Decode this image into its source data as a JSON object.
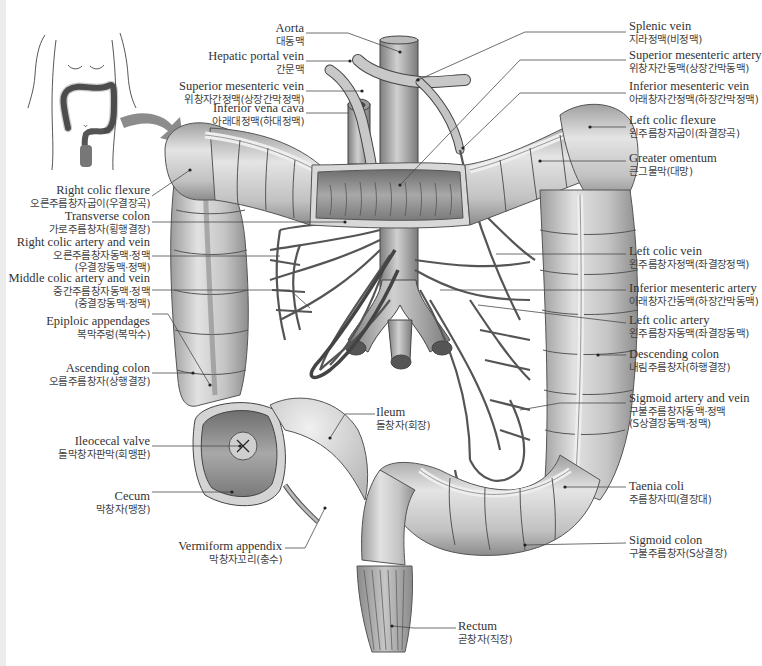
{
  "diagram": {
    "inset": {
      "description": "torso outline with colon location and arrow",
      "icon": "arrow-right-curved-icon"
    },
    "labels_left": [
      {
        "id": "aorta",
        "en": "Aorta",
        "ko": "대동맥"
      },
      {
        "id": "hepatic-portal-vein",
        "en": "Hepatic portal vein",
        "ko": "간문맥"
      },
      {
        "id": "superior-mesenteric-vein",
        "en": "Superior mesenteric vein",
        "ko": "위창자간정맥(상장간막정맥)"
      },
      {
        "id": "inferior-vena-cava",
        "en": "Inferior vena cava",
        "ko": "아래대정맥(하대정맥)"
      },
      {
        "id": "right-colic-flexure",
        "en": "Right colic flexure",
        "ko": "오른주름창자굽이(우결장곡)"
      },
      {
        "id": "transverse-colon",
        "en": "Transverse colon",
        "ko": "가로주름창자(횡행결장)"
      },
      {
        "id": "right-colic-artery-vein",
        "en": "Right colic artery and vein",
        "ko": "오른주름창자동맥·정맥",
        "ko2": "(우결장동맥·정맥)"
      },
      {
        "id": "middle-colic-artery-vein",
        "en": "Middle colic artery and vein",
        "ko": "중간주름창자동맥·정맥",
        "ko2": "(중결장동맥·정맥)"
      },
      {
        "id": "epiploic-appendages",
        "en": "Epiploic appendages",
        "ko": "복막주렁(복막수)"
      },
      {
        "id": "ascending-colon",
        "en": "Ascending colon",
        "ko": "오름주름창자(상행결장)"
      },
      {
        "id": "ileocecal-valve",
        "en": "Ileocecal valve",
        "ko": "돌막창자판막(회맹판)"
      },
      {
        "id": "cecum",
        "en": "Cecum",
        "ko": "막창자(맹장)"
      },
      {
        "id": "vermiform-appendix",
        "en": "Vermiform appendix",
        "ko": "막창자꼬리(충수)"
      }
    ],
    "labels_right": [
      {
        "id": "splenic-vein",
        "en": "Splenic vein",
        "ko": "지라정맥(비정맥)"
      },
      {
        "id": "superior-mesenteric-artery",
        "en": "Superior mesenteric artery",
        "ko": "위창자간동맥(상장간막동맥)"
      },
      {
        "id": "inferior-mesenteric-vein",
        "en": "Inferior mesenteric vein",
        "ko": "아래창자간정맥(하장간막정맥)"
      },
      {
        "id": "left-colic-flexure",
        "en": "Left colic flexure",
        "ko": "왼주름창자굽이(좌결장곡)"
      },
      {
        "id": "greater-omentum",
        "en": "Greater omentum",
        "ko": "큰그물막(대망)"
      },
      {
        "id": "left-colic-vein",
        "en": "Left colic vein",
        "ko": "왼주름창자정맥(좌결장정맥)"
      },
      {
        "id": "inferior-mesenteric-artery",
        "en": "Inferior mesenteric artery",
        "ko": "아래창자간동맥(하장간막동맥)"
      },
      {
        "id": "left-colic-artery",
        "en": "Left colic artery",
        "ko": "왼주름창자동맥(좌결장동맥)"
      },
      {
        "id": "descending-colon",
        "en": "Descending colon",
        "ko": "내림주름창자(하행결장)"
      },
      {
        "id": "sigmoid-artery-vein",
        "en": "Sigmoid artery and vein",
        "ko": "구불주름창자동맥·정맥",
        "ko2": "(S상결장동맥·정맥)"
      },
      {
        "id": "taenia-coli",
        "en": "Taenia coli",
        "ko": "주름창자띠(결장대)"
      },
      {
        "id": "sigmoid-colon",
        "en": "Sigmoid colon",
        "ko": "구불주름창자(S상결장)"
      }
    ],
    "labels_center": [
      {
        "id": "ileum",
        "en": "Ileum",
        "ko": "돌창자(회장)"
      },
      {
        "id": "rectum",
        "en": "Rectum",
        "ko": "곧창자(직장)"
      }
    ],
    "colors": {
      "background": "#ffffff",
      "colon_fill": "#c9c9c9",
      "colon_highlight": "#e6e6e6",
      "colon_shadow": "#8a8a8a",
      "vessel": "#9a9a9a",
      "outline": "#3a3a3a",
      "leader_line": "#4a4a4a",
      "inset_colon": "#6a6a6a",
      "arrow": "#8c8c8c"
    }
  }
}
